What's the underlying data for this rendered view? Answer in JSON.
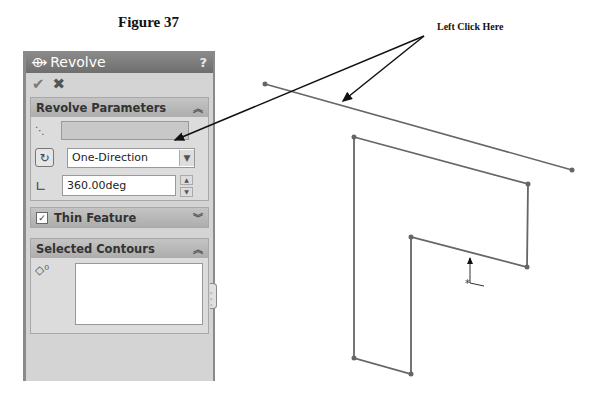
{
  "figure": {
    "title": "Figure 37",
    "callout": "Left Click Here"
  },
  "panel": {
    "title": "Revolve",
    "help": "?",
    "ok_icon": "✔",
    "cancel_icon": "✖",
    "revolve_parameters": {
      "title": "Revolve Parameters",
      "collapse": "︽",
      "axis_value": "",
      "direction": "One-Direction",
      "angle": "360.00deg"
    },
    "thin_feature": {
      "title": "Thin Feature",
      "checked": true,
      "check": "✓",
      "expand": "︾"
    },
    "selected_contours": {
      "title": "Selected Contours",
      "collapse": "︽",
      "count_icon": "◇⁰"
    }
  },
  "sketch": {
    "axis_line": [
      [
        265,
        84
      ],
      [
        572,
        170
      ]
    ],
    "profile": [
      [
        354,
        137
      ],
      [
        528,
        184
      ],
      [
        527,
        267
      ],
      [
        411,
        237
      ],
      [
        411,
        374
      ],
      [
        354,
        358
      ]
    ],
    "line_color": "#666666"
  }
}
